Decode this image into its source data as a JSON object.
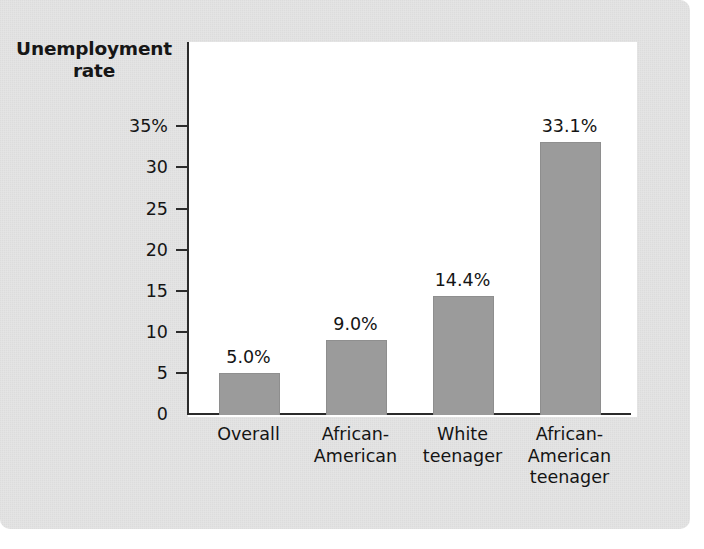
{
  "chart_data": {
    "type": "bar",
    "title": "",
    "ylabel": "Unemployment rate",
    "ylabel_lines": [
      "Unemployment",
      "rate"
    ],
    "xlabel": "",
    "categories": [
      "Overall",
      "African-American",
      "White teenager",
      "African-American teenager"
    ],
    "category_lines": [
      [
        "Overall"
      ],
      [
        "African-",
        "American"
      ],
      [
        "White",
        "teenager"
      ],
      [
        "African-",
        "American",
        "teenager"
      ]
    ],
    "values": [
      5.0,
      9.0,
      14.4,
      33.1
    ],
    "value_labels": [
      "5.0%",
      "9.0%",
      "14.4%",
      "33.1%"
    ],
    "ylim": [
      0,
      36.5
    ],
    "yticks": [
      0,
      5,
      10,
      15,
      20,
      25,
      30,
      35
    ],
    "ytick_labels": [
      "0",
      "5",
      "10",
      "15",
      "20",
      "25",
      "30",
      "35%"
    ],
    "grid": false,
    "legend": null,
    "bar_color": "#9b9b9b",
    "axis_color": "#2b2b2b",
    "plot_background": "#ffffff",
    "page_background": "#e4e4e4"
  }
}
